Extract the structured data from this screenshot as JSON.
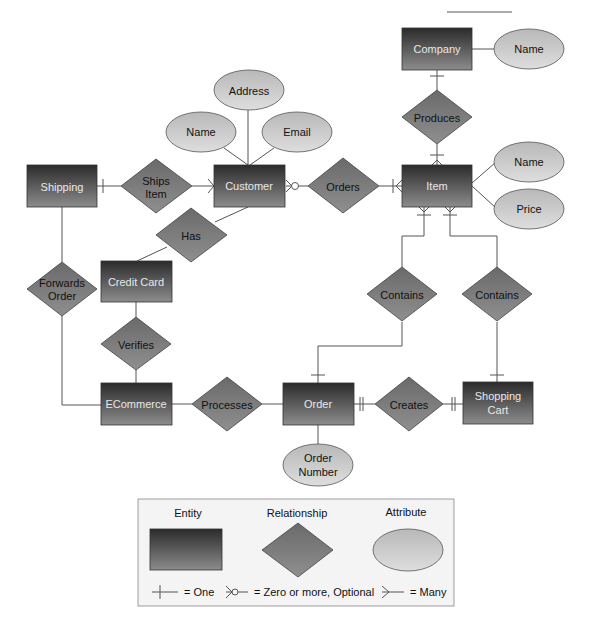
{
  "diagram": {
    "type": "entity-relationship",
    "entities": [
      {
        "id": "company",
        "label": "Company"
      },
      {
        "id": "shipping",
        "label": "Shipping"
      },
      {
        "id": "customer",
        "label": "Customer"
      },
      {
        "id": "item",
        "label": "Item"
      },
      {
        "id": "credit_card",
        "label": "Credit Card"
      },
      {
        "id": "ecommerce",
        "label": "ECommerce"
      },
      {
        "id": "order",
        "label": "Order"
      },
      {
        "id": "shopping_cart",
        "label_line1": "Shopping",
        "label_line2": "Cart"
      }
    ],
    "relationships": [
      {
        "id": "produces",
        "label": "Produces"
      },
      {
        "id": "ships_item",
        "label_line1": "Ships",
        "label_line2": "Item"
      },
      {
        "id": "orders",
        "label": "Orders"
      },
      {
        "id": "has",
        "label": "Has"
      },
      {
        "id": "forwards_order",
        "label_line1": "Forwards",
        "label_line2": "Order"
      },
      {
        "id": "verifies",
        "label": "Verifies"
      },
      {
        "id": "contains_order",
        "label": "Contains"
      },
      {
        "id": "contains_cart",
        "label": "Contains"
      },
      {
        "id": "processes",
        "label": "Processes"
      },
      {
        "id": "creates",
        "label": "Creates"
      }
    ],
    "attributes": [
      {
        "id": "company_name",
        "label": "Name"
      },
      {
        "id": "customer_address",
        "label": "Address"
      },
      {
        "id": "customer_name",
        "label": "Name"
      },
      {
        "id": "customer_email",
        "label": "Email"
      },
      {
        "id": "item_name",
        "label": "Name"
      },
      {
        "id": "item_price",
        "label": "Price"
      },
      {
        "id": "order_number",
        "label_line1": "Order",
        "label_line2": "Number"
      }
    ],
    "edges": [
      {
        "from": "Company",
        "to": "Produces",
        "end_notation": "one"
      },
      {
        "from": "Produces",
        "to": "Item",
        "end_notation": "one-or-many"
      },
      {
        "from": "Shipping",
        "to": "Ships Item",
        "start_notation": "one"
      },
      {
        "from": "Ships Item",
        "to": "Customer",
        "end_notation": "many"
      },
      {
        "from": "Customer",
        "to": "Orders",
        "start_notation": "zero-or-more"
      },
      {
        "from": "Orders",
        "to": "Item",
        "end_notation": "one-or-many"
      },
      {
        "from": "Customer",
        "to": "Has"
      },
      {
        "from": "Has",
        "to": "Credit Card"
      },
      {
        "from": "Shipping",
        "to": "Forwards Order"
      },
      {
        "from": "Forwards Order",
        "to": "ECommerce"
      },
      {
        "from": "Credit Card",
        "to": "Verifies"
      },
      {
        "from": "Verifies",
        "to": "ECommerce"
      },
      {
        "from": "Item",
        "to": "Contains (Order)",
        "start_notation": "one-or-many"
      },
      {
        "from": "Contains (Order)",
        "to": "Order",
        "end_notation": "one"
      },
      {
        "from": "Item",
        "to": "Contains (Cart)",
        "start_notation": "one-or-many"
      },
      {
        "from": "Contains (Cart)",
        "to": "Shopping Cart",
        "end_notation": "one"
      },
      {
        "from": "ECommerce",
        "to": "Processes"
      },
      {
        "from": "Processes",
        "to": "Order"
      },
      {
        "from": "Order",
        "to": "Creates",
        "start_notation": "exactly-one"
      },
      {
        "from": "Creates",
        "to": "Shopping Cart",
        "end_notation": "exactly-one"
      }
    ]
  },
  "legend": {
    "entity_label": "Entity",
    "relationship_label": "Relationship",
    "attribute_label": "Attribute",
    "one_label": "= One",
    "zero_more_label": "= Zero or more, Optional",
    "many_label": "= Many"
  },
  "colors": {
    "entity_top": "#2e2e2e",
    "entity_bottom": "#8a8a8a",
    "relationship": "#7a7a7a",
    "attribute": "#c9c9c9",
    "line": "#555555",
    "legend_bg": "#f4f4f4"
  }
}
